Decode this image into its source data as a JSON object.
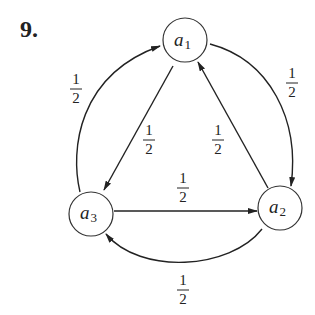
{
  "problem_number": "9.",
  "nodes": [
    {
      "id": "a1",
      "base": "a",
      "sub": "1",
      "cx": 185,
      "cy": 40
    },
    {
      "id": "a2",
      "base": "a",
      "sub": "2",
      "cx": 280,
      "cy": 208
    },
    {
      "id": "a3",
      "base": "a",
      "sub": "3",
      "cx": 91,
      "cy": 214
    }
  ],
  "edges": [
    {
      "from": "a3",
      "to": "a1",
      "label_num": "1",
      "label_den": "2",
      "kind": "outer-left-arc"
    },
    {
      "from": "a1",
      "to": "a2",
      "label_num": "1",
      "label_den": "2",
      "kind": "outer-right-arc"
    },
    {
      "from": "a2",
      "to": "a3",
      "label_num": "1",
      "label_den": "2",
      "kind": "outer-bottom-arc"
    },
    {
      "from": "a1",
      "to": "a3",
      "label_num": "1",
      "label_den": "2",
      "kind": "inner-line"
    },
    {
      "from": "a2",
      "to": "a1",
      "label_num": "1",
      "label_den": "2",
      "kind": "inner-line"
    },
    {
      "from": "a3",
      "to": "a2",
      "label_num": "1",
      "label_den": "2",
      "kind": "inner-line"
    }
  ],
  "colors": {
    "stroke": "#222222",
    "background": "#ffffff"
  }
}
